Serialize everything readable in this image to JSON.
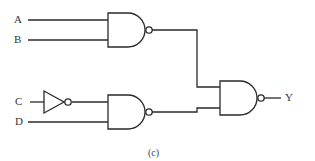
{
  "diagram": {
    "type": "logic-circuit",
    "caption": "(c)",
    "inputs": [
      {
        "label": "A"
      },
      {
        "label": "B"
      },
      {
        "label": "C"
      },
      {
        "label": "D"
      }
    ],
    "output": {
      "label": "Y"
    },
    "gates": [
      {
        "id": "nand1",
        "type": "NAND",
        "inputs": [
          "A",
          "B"
        ]
      },
      {
        "id": "not1",
        "type": "NOT",
        "inputs": [
          "C"
        ]
      },
      {
        "id": "nand2",
        "type": "NAND",
        "inputs": [
          "NOT C",
          "D"
        ]
      },
      {
        "id": "nand3",
        "type": "NAND",
        "inputs": [
          "nand1",
          "nand2"
        ],
        "output": "Y"
      }
    ],
    "line_color": "#2a2a2a"
  }
}
